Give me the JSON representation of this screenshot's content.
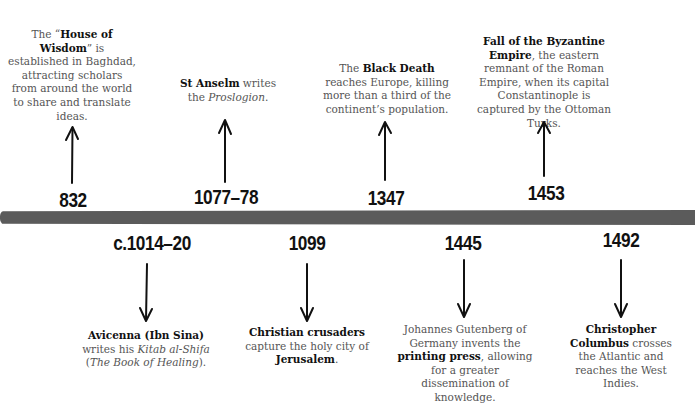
{
  "timeline": {
    "bar_color": "#5b5b5b",
    "above": [
      {
        "year": "832",
        "text_parts": [
          {
            "t": "The “",
            "s": "normal"
          },
          {
            "t": "House of Wisdom",
            "s": "bold"
          },
          {
            "t": "” is established in Baghdad, attracting scholars from around the world to share and translate ideas.",
            "s": "normal"
          }
        ]
      },
      {
        "year": "1077–78",
        "text_parts": [
          {
            "t": "St Anselm",
            "s": "bold"
          },
          {
            "t": " writes the ",
            "s": "normal"
          },
          {
            "t": "Proslogion",
            "s": "italic"
          },
          {
            "t": ".",
            "s": "normal"
          }
        ]
      },
      {
        "year": "1347",
        "text_parts": [
          {
            "t": "The ",
            "s": "normal"
          },
          {
            "t": "Black Death",
            "s": "bold"
          },
          {
            "t": " reaches Europe, killing more than a third of the continent’s population.",
            "s": "normal"
          }
        ]
      },
      {
        "year": "1453",
        "text_parts": [
          {
            "t": "Fall of the Byzantine Empire",
            "s": "bold"
          },
          {
            "t": ", the eastern remnant of the Roman Empire, when its capital Constantinople is captured by the Ottoman Turks.",
            "s": "normal"
          }
        ]
      }
    ],
    "below": [
      {
        "year": "c.1014–20",
        "text_parts": [
          {
            "t": "Avicenna (Ibn Sina)",
            "s": "bold"
          },
          {
            "t": " writes his ",
            "s": "normal"
          },
          {
            "t": "Kitab al-Shifa",
            "s": "italic"
          },
          {
            "t": " (",
            "s": "normal"
          },
          {
            "t": "The Book of Healing",
            "s": "italic"
          },
          {
            "t": ").",
            "s": "normal"
          }
        ]
      },
      {
        "year": "1099",
        "text_parts": [
          {
            "t": "Christian crusaders",
            "s": "bold"
          },
          {
            "t": " capture the holy city of ",
            "s": "normal"
          },
          {
            "t": "Jerusalem",
            "s": "bold"
          },
          {
            "t": ".",
            "s": "normal"
          }
        ]
      },
      {
        "year": "1445",
        "text_parts": [
          {
            "t": "Johannes Gutenberg of Germany invents the ",
            "s": "normal"
          },
          {
            "t": "printing press",
            "s": "bold"
          },
          {
            "t": ", allowing for a greater dissemination of knowledge.",
            "s": "normal"
          }
        ]
      },
      {
        "year": "1492",
        "text_parts": [
          {
            "t": "Christopher Columbus",
            "s": "bold"
          },
          {
            "t": " crosses the Atlantic and reaches the West Indies.",
            "s": "normal"
          }
        ]
      }
    ]
  }
}
